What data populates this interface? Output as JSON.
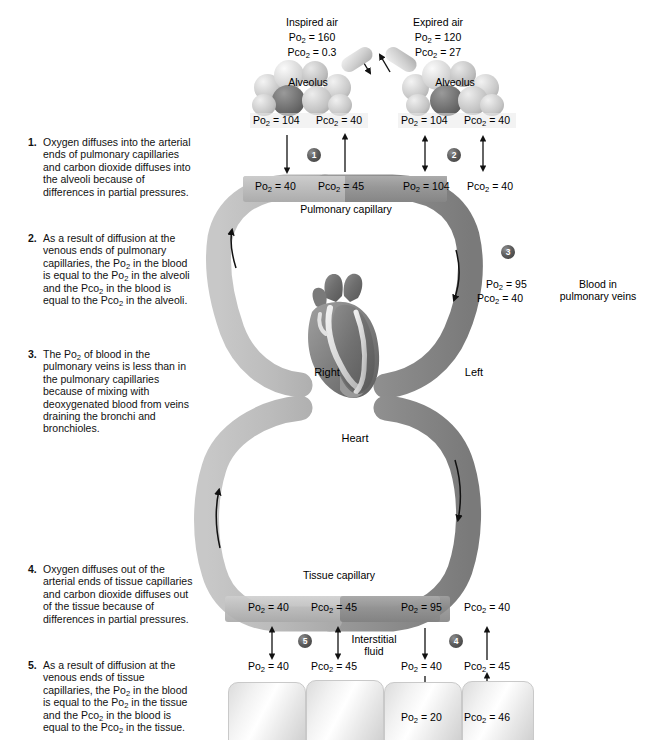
{
  "steps": [
    {
      "num": "1.",
      "text": "Oxygen diffuses into the arterial ends of pulmonary capillaries and carbon dioxide diffuses into the alveoli because of differences in partial pressures."
    },
    {
      "num": "2.",
      "text": "As a result of diffusion at the venous ends of pulmonary capillaries, the Po2 in the blood is equal to the Po2 in the alveoli and the Pco2 in the blood is equal to the Pco2 in the alveoli."
    },
    {
      "num": "3.",
      "text": "The Po2 of blood in the pulmonary veins is less than in the pulmonary capillaries because of mixing with deoxygenated blood from veins draining the bronchi and bronchioles."
    },
    {
      "num": "4.",
      "text": "Oxygen diffuses out of the arterial ends of tissue capillaries and carbon dioxide diffuses out of the tissue because of differences in partial pressures."
    },
    {
      "num": "5.",
      "text": "As a result of diffusion at the venous ends of tissue capillaries, the Po2 in the blood  is equal to the Po2 in the tissue and the Pco2 in the blood is equal to the Pco2 in the tissue."
    }
  ],
  "air": {
    "inspired_label": "Inspired air",
    "inspired_po2": "Po2 = 160",
    "inspired_pco2": "Pco2 = 0.3",
    "expired_label": "Expired air",
    "expired_po2": "Po2 = 120",
    "expired_pco2": "Pco2 = 27"
  },
  "alveoli": {
    "left_label": "Alveolus",
    "left_po2": "Po2 = 104",
    "left_pco2": "Pco2 = 40",
    "right_label": "Alveolus",
    "right_po2": "Po2 = 104",
    "right_pco2": "Pco2 = 40"
  },
  "pulmonary": {
    "capillary_label": "Pulmonary capillary",
    "arterial_po2": "Po2 = 40",
    "arterial_pco2": "Pco2 = 45",
    "venous_po2": "Po2 = 104",
    "venous_pco2": "Pco2 = 40",
    "veins_po2": "Po2 = 95",
    "veins_pco2": "Pco2 = 40",
    "veins_label": "Blood in pulmonary veins"
  },
  "heart": {
    "right_label": "Right",
    "left_label": "Left",
    "heart_label": "Heart"
  },
  "tissue": {
    "capillary_label": "Tissue capillary",
    "interstitial_label": "Interstitial fluid",
    "venous_po2": "Po2 = 40",
    "venous_pco2": "Pco2 = 45",
    "arterial_po2": "Po2 = 95",
    "arterial_pco2": "Pco2 = 40",
    "fluid_venous_po2": "Po2 = 40",
    "fluid_venous_pco2": "Pco2 = 45",
    "fluid_arterial_po2": "Po2 = 40",
    "fluid_arterial_pco2": "Pco2 = 45",
    "cell_po2": "Po2 = 20",
    "cell_pco2": "Pco2 = 46"
  },
  "badges": {
    "b1": "1",
    "b2": "2",
    "b3": "3",
    "b4": "4",
    "b5": "5"
  },
  "colors": {
    "deoxygenated_vessel": "#b9b9b9",
    "oxygenated_vessel": "#8e8e8e",
    "badge_fill": "#4a4a4a",
    "text": "#000000",
    "background": "#ffffff"
  }
}
